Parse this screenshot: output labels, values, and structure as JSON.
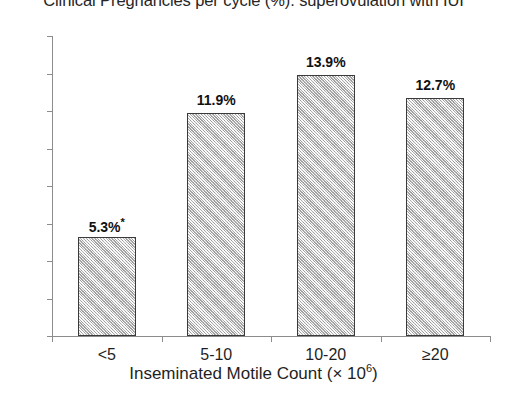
{
  "chart_data": {
    "type": "bar",
    "title": "Clinical Pregnancies per cycle (%): superovulation with IUI",
    "xlabel_text": "Inseminated Motile Count (× 10",
    "xlabel_sup": "6",
    "xlabel_tail": ")",
    "ylabel": "",
    "categories": [
      "<5",
      "5-10",
      "10-20",
      "≥20"
    ],
    "values": [
      5.3,
      11.9,
      13.9,
      12.7
    ],
    "value_labels": [
      "5.3%",
      "11.9%",
      "13.9%",
      "12.7%"
    ],
    "annotations": [
      "*",
      "",
      "",
      ""
    ],
    "ylim": [
      0,
      16
    ],
    "ytick_values": [
      0,
      2,
      4,
      6,
      8,
      10,
      12,
      14,
      16
    ],
    "ytick_labels": [
      "0%",
      "2%",
      "4%",
      "6%",
      "8%",
      "10%",
      "12%",
      "14%",
      "16%"
    ],
    "grid": false,
    "legend": "none",
    "bar_fill_color": "#cfcfcf",
    "bar_border_color": "#3a3a3a",
    "axis_color": "#8c8c8c",
    "background_color": "#ffffff"
  }
}
